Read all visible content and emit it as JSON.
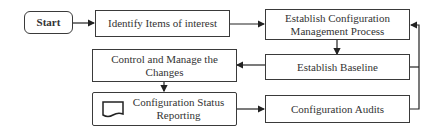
{
  "diagram": {
    "nodes": {
      "start": "Start",
      "identify": "Identify Items of interest",
      "establish_process_line1": "Establish Configuration",
      "establish_process_line2": "Management Process",
      "baseline": "Establish Baseline",
      "control_line1": "Control and Manage the",
      "control_line2": "Changes",
      "status_line1": "Configuration Status",
      "status_line2": "Reporting",
      "audits": "Configuration Audits"
    },
    "edges": [
      {
        "from": "start",
        "to": "identify"
      },
      {
        "from": "identify",
        "to": "establish_process"
      },
      {
        "from": "establish_process",
        "to": "baseline"
      },
      {
        "from": "baseline",
        "to": "control"
      },
      {
        "from": "control",
        "to": "status"
      },
      {
        "from": "status",
        "to": "audits"
      },
      {
        "from": "audits",
        "to": "establish_process",
        "type": "feedback"
      },
      {
        "from": "baseline",
        "to": "establish_process",
        "type": "feedback"
      }
    ],
    "colors": {
      "stroke": "#3a3a3a",
      "background": "#ffffff"
    }
  }
}
